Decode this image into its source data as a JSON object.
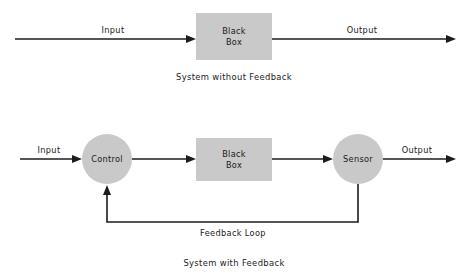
{
  "diagram": {
    "title_top": "System without Feedback",
    "title_bottom": "System with Feedback",
    "colors": {
      "shape_fill": "#c9c9c9",
      "line": "#1c1c1c",
      "background": "#ffffff",
      "text": "#1a1a1a"
    },
    "top_system": {
      "input_label": "Input",
      "output_label": "Output",
      "box": {
        "line1": "Black",
        "line2": "Box"
      },
      "caption": "System without Feedback"
    },
    "bottom_system": {
      "input_label": "Input",
      "output_label": "Output",
      "control": "Control",
      "box": {
        "line1": "Black",
        "line2": "Box"
      },
      "sensor": "Sensor",
      "feedback_label": "Feedback Loop",
      "caption": "System with Feedback"
    }
  }
}
